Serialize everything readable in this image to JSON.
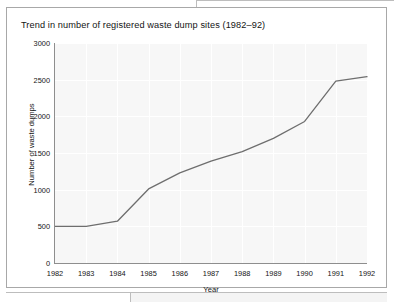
{
  "figure": {
    "title": "Trend in number of registered waste dump sites (1982–92)"
  },
  "chart_data": {
    "type": "line",
    "title": "Trend in number of registered waste dump sites (1982–92)",
    "xlabel": "Year",
    "ylabel": "Number of waste dumps",
    "categories": [
      "1982",
      "1983",
      "1984",
      "1985",
      "1986",
      "1987",
      "1988",
      "1989",
      "1990",
      "1991",
      "1992"
    ],
    "x": [
      1982,
      1983,
      1984,
      1985,
      1986,
      1987,
      1988,
      1989,
      1990,
      1991,
      1992
    ],
    "values": [
      500,
      500,
      570,
      1010,
      1230,
      1390,
      1520,
      1700,
      1930,
      2480,
      2540
    ],
    "series": [
      {
        "name": "Registered waste dump sites",
        "values": [
          500,
          500,
          570,
          1010,
          1230,
          1390,
          1520,
          1700,
          1930,
          2480,
          2540
        ]
      }
    ],
    "xlim": [
      1982,
      1992
    ],
    "ylim": [
      0,
      3000
    ],
    "ytick_labels": [
      "0",
      "500",
      "1000",
      "1500",
      "2000",
      "2500",
      "3000"
    ],
    "ytick_values": [
      0,
      500,
      1000,
      1500,
      2000,
      2500,
      3000
    ],
    "xtick_labels": [
      "1982",
      "1983",
      "1984",
      "1985",
      "1986",
      "1987",
      "1988",
      "1989",
      "1990",
      "1991",
      "1992"
    ],
    "grid": true,
    "legend": false,
    "line_color": "#6e6e6e",
    "plot_background": "#f7f7f7",
    "gridline_color": "#ffffff",
    "axis_color": "#8e8e8e"
  }
}
